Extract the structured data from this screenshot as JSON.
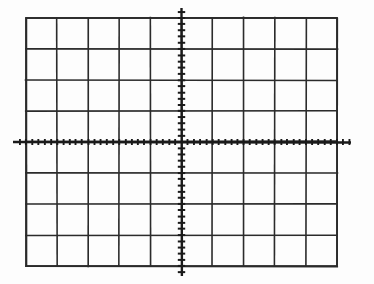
{
  "figure": {
    "title": "Oscilloscope Graticule",
    "background_color": "#fdfdfd",
    "line_color": "#2b2b2b",
    "axis_color": "#1a1a1a"
  },
  "chart_data": {
    "type": "grid",
    "title": "Oscilloscope Graticule",
    "xlabel": "",
    "ylabel": "",
    "grid": true,
    "legend": "none",
    "divisions_x": 10,
    "divisions_y": 8,
    "subdivisions_per_division": 5,
    "xlim": [
      -5,
      5
    ],
    "ylim": [
      -4,
      4
    ],
    "xticks": [
      -5,
      -4,
      -3,
      -2,
      -1,
      0,
      1,
      2,
      3,
      4,
      5
    ],
    "yticks": [
      -4,
      -3,
      -2,
      -1,
      0,
      1,
      2,
      3,
      4
    ],
    "xtick_labels": [
      "",
      "",
      "",
      "",
      "",
      "",
      "",
      "",
      "",
      "",
      ""
    ],
    "ytick_labels": [
      "",
      "",
      "",
      "",
      "",
      "",
      "",
      "",
      ""
    ],
    "series": [],
    "annotations": []
  },
  "geometry": {
    "grid_left": 26,
    "grid_top": 18,
    "grid_right": 337,
    "grid_bottom": 266,
    "cell_width": 31.1,
    "cell_height": 31.0,
    "center_x": 181.5,
    "center_y": 142,
    "axis_x_start": 13,
    "axis_x_end": 351,
    "axis_y_start": 8,
    "axis_y_end": 276,
    "minor_tick_spacing_x": 6.22,
    "minor_tick_spacing_y": 6.2,
    "minor_tick_length": 5,
    "grid_line_width": 1.6,
    "axis_line_width": 2.4
  },
  "labels": {
    "figure_name": "graticule-figure",
    "grid_name": "graticule-grid",
    "x_axis_name": "horizontal-axis",
    "y_axis_name": "vertical-axis",
    "x_ticks_name": "horizontal-axis-ticks",
    "y_ticks_name": "vertical-axis-ticks",
    "border_name": "graticule-border"
  }
}
